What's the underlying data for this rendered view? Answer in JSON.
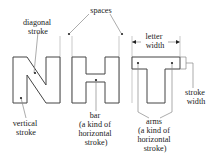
{
  "diagram": {
    "letters": [
      "N",
      "H",
      "T"
    ],
    "labels": {
      "diagonal_stroke": [
        "diagonal",
        "stroke"
      ],
      "spaces": [
        "spaces"
      ],
      "letter_width": [
        "letter",
        "width"
      ],
      "vertical_stroke": [
        "vertical",
        "stroke"
      ],
      "bar": [
        "bar",
        "(a kind of",
        "horizontal",
        "stroke)"
      ],
      "arms": [
        "arms",
        "(a kind of",
        "horizontal",
        "stroke)"
      ],
      "stroke_width": [
        "stroke",
        "width"
      ]
    }
  }
}
